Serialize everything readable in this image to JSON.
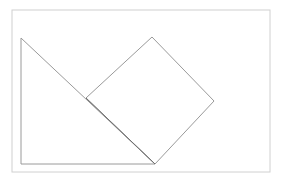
{
  "document": {
    "title": "Geometric figure: right triangle with attached square",
    "background_color": "#ffffff",
    "width": 291,
    "height": 183
  },
  "frame": {
    "name": "outer-border",
    "stroke_color": "#d0d0d0",
    "stroke_width": 1,
    "x": 12,
    "y": 10,
    "width": 258,
    "height": 162
  },
  "figure": {
    "stroke_color": "#9a9a9a",
    "overlap_stroke_color": "#6f6f6f",
    "stroke_width": 1,
    "fill": "none",
    "shapes": [
      {
        "name": "right-triangle",
        "type": "polygon",
        "label": "triangle",
        "points": "21,38 21,164 155,164",
        "vertices": [
          {
            "label": "apex-top-left",
            "x": 21,
            "y": 38
          },
          {
            "label": "bottom-left",
            "x": 21,
            "y": 164
          },
          {
            "label": "bottom-right",
            "x": 155,
            "y": 164
          }
        ]
      },
      {
        "name": "square-diamond",
        "type": "polygon",
        "label": "square",
        "points": "86,98 152,37 214,101 155,164",
        "vertices": [
          {
            "label": "left",
            "x": 86,
            "y": 98
          },
          {
            "label": "top",
            "x": 152,
            "y": 37
          },
          {
            "label": "right",
            "x": 214,
            "y": 101
          },
          {
            "label": "bottom",
            "x": 155,
            "y": 164
          }
        ]
      }
    ],
    "overlap_segment": {
      "name": "shared-hypotenuse-segment",
      "x1": 86,
      "y1": 98,
      "x2": 155,
      "y2": 164
    }
  }
}
